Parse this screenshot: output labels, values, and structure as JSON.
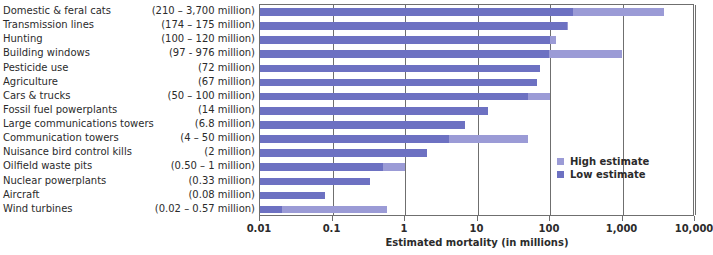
{
  "chart_data": {
    "type": "bar",
    "orientation": "horizontal",
    "title": "",
    "xlabel": "Estimated mortality (in millions)",
    "ylabel": "",
    "xscale": "log",
    "xlim": [
      0.01,
      10000
    ],
    "xticks": [
      "0.01",
      "0.1",
      "1",
      "10",
      "100",
      "1,000",
      "10,000"
    ],
    "xtick_values": [
      0.01,
      0.1,
      1,
      10,
      100,
      1000,
      10000
    ],
    "grid": true,
    "legend_position": "inside-right",
    "categories": [
      "Domestic & feral cats",
      "Transmission lines",
      "Hunting",
      "Building windows",
      "Pesticide use",
      "Agriculture",
      "Cars & trucks",
      "Fossil fuel powerplants",
      "Large communications towers",
      "Communication towers",
      "Nuisance bird control kills",
      "Oilfield waste pits",
      "Nuclear powerplants",
      "Aircraft",
      "Wind turbines"
    ],
    "value_labels": [
      "(210 – 3,700 million)",
      "(174 – 175 million)",
      "(100 – 120 million)",
      "(97 - 976 million)",
      "(72 million)",
      "(67 million)",
      "(50 – 100 million)",
      "(14 million)",
      "(6.8 million)",
      "(4 – 50 million)",
      "(2 million)",
      "(0.50 – 1 million)",
      "(0.33 million)",
      "(0.08 million)",
      "(0.02 – 0.57 million)"
    ],
    "series": [
      {
        "name": "High estimate",
        "color": "#9b9bd6",
        "values": [
          3700,
          175,
          120,
          976,
          72,
          67,
          100,
          14,
          6.8,
          50,
          2,
          1,
          0.33,
          0.08,
          0.57
        ]
      },
      {
        "name": "Low estimate",
        "color": "#6d71c2",
        "values": [
          210,
          174,
          100,
          97,
          72,
          67,
          50,
          14,
          6.8,
          4,
          2,
          0.5,
          0.33,
          0.08,
          0.02
        ]
      }
    ]
  },
  "legend": {
    "items": [
      {
        "label": "High estimate",
        "key": "high"
      },
      {
        "label": "Low estimate",
        "key": "low"
      }
    ]
  },
  "axis": {
    "title": "Estimated mortality (in millions)"
  }
}
